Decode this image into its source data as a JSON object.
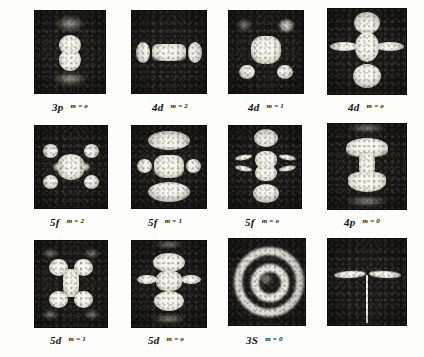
{
  "figure": {
    "type": "photo-plate-grid",
    "rows": 3,
    "columns": 4,
    "background_color": "#fdfdfb",
    "plate_color": "#1b1a18",
    "density_color": "#f2f1e8"
  },
  "panels": [
    {
      "id": "panel-3p-m0",
      "orbital": "3p",
      "m_label": "m = o",
      "m_value": "0",
      "shell": "3",
      "subshell": "p",
      "pattern": "two-vertical-lobes-with-faint-caps",
      "x": 34,
      "y": 10,
      "w": 72,
      "h": 84,
      "label_x": 52,
      "label_y": 97
    },
    {
      "id": "panel-4d-m2",
      "orbital": "4d",
      "m_label": "m = 2",
      "m_value": "2",
      "shell": "4",
      "subshell": "d",
      "pattern": "horizontal-bar-with-end-lobes",
      "x": 131,
      "y": 10,
      "w": 76,
      "h": 84,
      "label_x": 152,
      "label_y": 97
    },
    {
      "id": "panel-4d-m1",
      "orbital": "4d",
      "m_label": "m = 1",
      "m_value": "1",
      "shell": "4",
      "subshell": "d",
      "pattern": "central-square-with-four-corner-lobes",
      "x": 228,
      "y": 10,
      "w": 76,
      "h": 84,
      "label_x": 248,
      "label_y": 97
    },
    {
      "id": "panel-4d-m0",
      "orbital": "4d",
      "m_label": "m = o",
      "m_value": "0",
      "shell": "4",
      "subshell": "d",
      "pattern": "cross-with-top-and-bottom-caps",
      "x": 327,
      "y": 8,
      "w": 80,
      "h": 87,
      "label_x": 348,
      "label_y": 97
    },
    {
      "id": "panel-5f-m2",
      "orbital": "5f",
      "m_label": "m = 2",
      "m_value": "2",
      "shell": "5",
      "subshell": "f",
      "pattern": "bowtie-core-with-four-corner-lobes",
      "x": 34,
      "y": 125,
      "w": 74,
      "h": 84,
      "label_x": 50,
      "label_y": 212
    },
    {
      "id": "panel-5f-m1",
      "orbital": "5f",
      "m_label": "m = 1",
      "m_value": "1",
      "shell": "5",
      "subshell": "f",
      "pattern": "three-stacked-bars-with-side-lobes",
      "x": 131,
      "y": 125,
      "w": 76,
      "h": 84,
      "label_x": 148,
      "label_y": 212
    },
    {
      "id": "panel-5f-m0",
      "orbital": "5f",
      "m_label": "m = o",
      "m_value": "0",
      "shell": "5",
      "subshell": "f",
      "pattern": "stacked-lobes-with-lateral-spikes",
      "x": 228,
      "y": 125,
      "w": 74,
      "h": 84,
      "label_x": 245,
      "label_y": 212
    },
    {
      "id": "panel-4p-m0",
      "orbital": "4p",
      "m_label": "m = 0",
      "m_value": "0",
      "shell": "4",
      "subshell": "p",
      "pattern": "hourglass-column-with-caps",
      "x": 327,
      "y": 123,
      "w": 80,
      "h": 87,
      "label_x": 344,
      "label_y": 212
    },
    {
      "id": "panel-5d-m1",
      "orbital": "5d",
      "m_label": "m = 1",
      "m_value": "1",
      "shell": "5",
      "subshell": "d",
      "pattern": "double-dumbbell-h-shape",
      "x": 34,
      "y": 240,
      "w": 74,
      "h": 88,
      "label_x": 50,
      "label_y": 330
    },
    {
      "id": "panel-5d-m0",
      "orbital": "5d",
      "m_label": "m = o",
      "m_value": "0",
      "shell": "5",
      "subshell": "d",
      "pattern": "stacked-column-with-side-arms",
      "x": 131,
      "y": 240,
      "w": 76,
      "h": 88,
      "label_x": 148,
      "label_y": 330
    },
    {
      "id": "panel-3s-m0",
      "orbital": "3S",
      "m_label": "m = 0",
      "m_value": "0",
      "shell": "3",
      "subshell": "S",
      "pattern": "concentric-rings-bullseye",
      "x": 228,
      "y": 238,
      "w": 78,
      "h": 88,
      "label_x": 246,
      "label_y": 330
    },
    {
      "id": "panel-blank",
      "orbital": "",
      "m_label": "",
      "m_value": "",
      "shell": "",
      "subshell": "",
      "pattern": "horizontal-double-wedge-with-vertical-line",
      "x": 327,
      "y": 238,
      "w": 80,
      "h": 88,
      "label_x": 348,
      "label_y": 330
    }
  ]
}
